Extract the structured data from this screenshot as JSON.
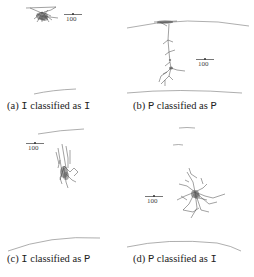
{
  "figure": {
    "panels": [
      {
        "id": "a",
        "label": "(a)",
        "true_class": "I",
        "middle_text": "classified as",
        "predicted_class": "I",
        "scale_bar": "100"
      },
      {
        "id": "b",
        "label": "(b)",
        "true_class": "P",
        "middle_text": "classified as",
        "predicted_class": "P",
        "scale_bar": "100"
      },
      {
        "id": "c",
        "label": "(c)",
        "true_class": "I",
        "middle_text": "classified as",
        "predicted_class": "P",
        "scale_bar": "100"
      },
      {
        "id": "d",
        "label": "(d)",
        "true_class": "P",
        "middle_text": "classified as",
        "predicted_class": "I",
        "scale_bar": "100"
      }
    ]
  }
}
